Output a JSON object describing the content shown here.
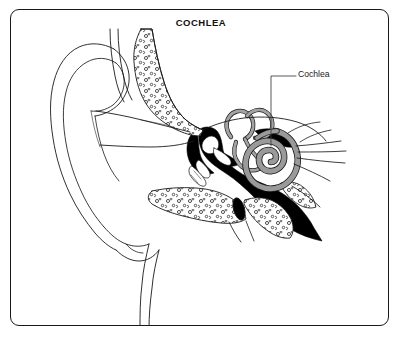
{
  "figure": {
    "title": "COCHLEA",
    "type": "anatomical-illustration",
    "frame": {
      "style": "rounded-rectangle-border",
      "color": "#1a1a1a"
    },
    "background_color": "#ffffff"
  },
  "callouts": [
    {
      "label": "Cochlea",
      "leader_line": "horizontal-then-vertical",
      "points_to": "spiral-cochlea"
    }
  ],
  "palette": {
    "ink": "#1a1a1a",
    "bone_fill": "#ffffff",
    "cavity_fill": "#000000",
    "cochlea_gray": "#9a9a9a",
    "canal_gray": "#a3a3a3",
    "paper": "#ffffff"
  },
  "structures": [
    {
      "name": "pinna",
      "label": "outer ear / auricle",
      "fill": "white",
      "outline": "line-art"
    },
    {
      "name": "ear-canal",
      "label": "external auditory canal",
      "fill": "white"
    },
    {
      "name": "temporal-bone-upper",
      "label": "temporal bone",
      "fill": "stippled"
    },
    {
      "name": "temporal-bone-lower",
      "label": "temporal bone",
      "fill": "stippled"
    },
    {
      "name": "middle-ear-cavity",
      "label": "tympanic cavity",
      "fill": "black"
    },
    {
      "name": "ossicles",
      "label": "malleus incus stapes",
      "fill": "white"
    },
    {
      "name": "semicircular-canals",
      "label": "semicircular canals",
      "fill": "gray"
    },
    {
      "name": "spiral-cochlea",
      "label": "cochlea",
      "fill": "gray"
    },
    {
      "name": "auditory-nerve",
      "label": "vestibulocochlear nerve",
      "fill": "line-art"
    },
    {
      "name": "eustachian-tube",
      "label": "eustachian tube",
      "fill": "white"
    },
    {
      "name": "mastoid-wedge",
      "label": "mastoid region",
      "fill": "black"
    },
    {
      "name": "neck-contour",
      "label": "jaw and neck contour",
      "fill": "line-art"
    }
  ]
}
